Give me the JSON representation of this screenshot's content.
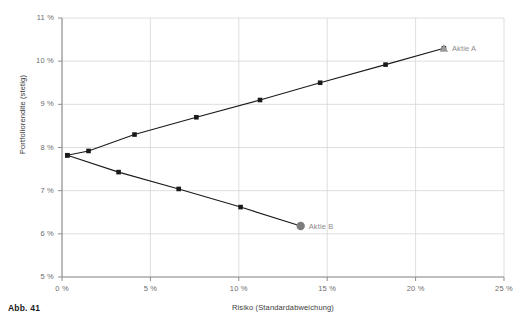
{
  "caption": "Abb. 41",
  "chart_data": {
    "type": "line",
    "title": "",
    "xlabel": "Risiko (Standardabweichung)",
    "ylabel": "Portfoliorendite (stetig)",
    "xlim": [
      0,
      25
    ],
    "ylim": [
      5,
      11
    ],
    "x_ticks": [
      "0 %",
      "5 %",
      "10 %",
      "15 %",
      "20 %",
      "25 %"
    ],
    "x_tick_values": [
      0,
      5,
      10,
      15,
      20,
      25
    ],
    "y_ticks": [
      "5 %",
      "6 %",
      "7 %",
      "8 %",
      "9 %",
      "10 %",
      "11 %"
    ],
    "y_tick_values": [
      5,
      6,
      7,
      8,
      9,
      10,
      11
    ],
    "grid": true,
    "legend": "none",
    "unit": "%",
    "series": [
      {
        "name": "efficient-frontier-upper",
        "marker": "square",
        "color": "#1a1a1a",
        "points": [
          {
            "x": 0.3,
            "y": 7.82
          },
          {
            "x": 1.5,
            "y": 7.92
          },
          {
            "x": 4.1,
            "y": 8.3
          },
          {
            "x": 7.6,
            "y": 8.7
          },
          {
            "x": 11.2,
            "y": 9.1
          },
          {
            "x": 14.6,
            "y": 9.5
          },
          {
            "x": 18.3,
            "y": 9.92
          },
          {
            "x": 21.6,
            "y": 10.3
          }
        ]
      },
      {
        "name": "inefficient-frontier-lower",
        "marker": "square",
        "color": "#1a1a1a",
        "points": [
          {
            "x": 0.3,
            "y": 7.82
          },
          {
            "x": 3.2,
            "y": 7.43
          },
          {
            "x": 6.6,
            "y": 7.04
          },
          {
            "x": 10.1,
            "y": 6.62
          },
          {
            "x": 13.5,
            "y": 6.18
          }
        ]
      }
    ],
    "annotations": [
      {
        "label": "Aktie A",
        "x": 21.6,
        "y": 10.3,
        "marker": "triangle",
        "color": "#9a9a9a"
      },
      {
        "label": "Aktie B",
        "x": 13.5,
        "y": 6.18,
        "marker": "circle",
        "color": "#7d7d7d"
      }
    ]
  },
  "colors": {
    "line": "#1a1a1a",
    "grid": "#d6d6d6",
    "axis": "#8f8f8f",
    "marker_gray": "#8f8f8f",
    "text": "#3a3a3a",
    "label_gray": "#8c8c8c"
  }
}
